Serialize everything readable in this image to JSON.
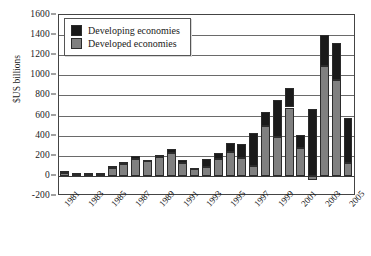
{
  "chart_data": {
    "type": "bar",
    "stacked": true,
    "title": "",
    "xlabel": "",
    "ylabel": "$US billions",
    "ylim": [
      -200,
      1600
    ],
    "ytick_step": 200,
    "yticks": [
      1600,
      1400,
      1200,
      1000,
      800,
      600,
      400,
      200,
      0,
      -200
    ],
    "grid": true,
    "legend_position": "top-left",
    "categories": [
      "1981",
      "1982",
      "1983",
      "1984",
      "1985",
      "1986",
      "1987",
      "1988",
      "1989",
      "1990",
      "1991",
      "1992",
      "1993",
      "1994",
      "1995",
      "1996",
      "1997",
      "1998",
      "1999",
      "2000",
      "2001",
      "2002",
      "2003",
      "2004",
      "2005"
    ],
    "tick_labels": [
      "1981",
      "",
      "1983",
      "",
      "1985",
      "",
      "1987",
      "",
      "1989",
      "",
      "1991",
      "",
      "1993",
      "",
      "1995",
      "",
      "1997",
      "",
      "1999",
      "",
      "2001",
      "",
      "2003",
      "",
      "2005"
    ],
    "series": [
      {
        "name": "Developed economies",
        "color": "#808080",
        "values": [
          30,
          20,
          22,
          25,
          80,
          115,
          165,
          155,
          185,
          230,
          130,
          75,
          90,
          170,
          240,
          180,
          100,
          500,
          390,
          680,
          275,
          -40,
          1090,
          950,
          130
        ]
      },
      {
        "name": "Developing economies",
        "color": "#1a1a1a",
        "values": [
          15,
          8,
          8,
          8,
          15,
          20,
          35,
          5,
          25,
          35,
          30,
          -10,
          75,
          60,
          90,
          135,
          325,
          135,
          360,
          195,
          130,
          665,
          310,
          370,
          450
        ]
      }
    ],
    "totals": [
      45,
      28,
      30,
      33,
      95,
      135,
      200,
      160,
      210,
      265,
      160,
      65,
      165,
      230,
      330,
      315,
      425,
      635,
      750,
      875,
      405,
      625,
      1400,
      1320,
      580
    ]
  },
  "legend": {
    "items": [
      {
        "label": "Developing economies",
        "color": "#1a1a1a"
      },
      {
        "label": "Developed economies",
        "color": "#808080"
      }
    ]
  }
}
